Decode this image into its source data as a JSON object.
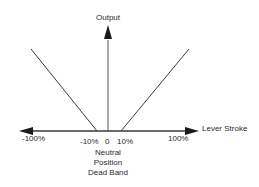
{
  "diagram": {
    "y_axis_label": "Output",
    "x_axis_label": "Lever Stroke",
    "tick_labels": {
      "neg_100": "-100%",
      "neg_10": "-10%",
      "zero": "0",
      "pos_10": "10%",
      "pos_100": "100%"
    },
    "annotation": {
      "line1": "Neutral",
      "line2": "Position",
      "line3": "Dead Band"
    },
    "colors": {
      "line": "#3a3a3a",
      "text": "#2a2a2a"
    },
    "curve": {
      "dead_band_percent": [
        -10,
        10
      ],
      "description": "V-shaped output: zero within ±10% dead band, rising linearly to max at ±100% lever stroke"
    }
  }
}
